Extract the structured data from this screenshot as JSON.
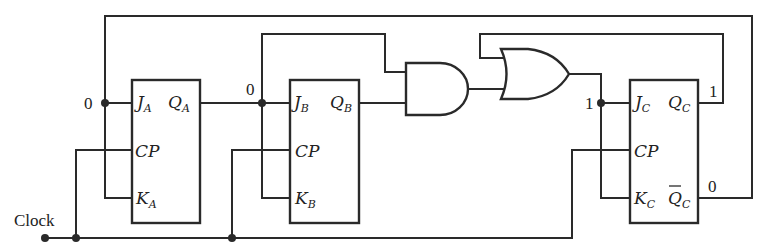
{
  "diagram": {
    "type": "sequential-logic-circuit",
    "clock_label": "Clock",
    "flip_flops": [
      {
        "id": "A",
        "pins": {
          "J": "J",
          "J_sub": "A",
          "Q": "Q",
          "Q_sub": "A",
          "CP": "CP",
          "K": "K",
          "K_sub": "A"
        },
        "input_state": "0"
      },
      {
        "id": "B",
        "pins": {
          "J": "J",
          "J_sub": "B",
          "Q": "Q",
          "Q_sub": "B",
          "CP": "CP",
          "K": "K",
          "K_sub": "B"
        },
        "input_state": "0"
      },
      {
        "id": "C",
        "pins": {
          "J": "J",
          "J_sub": "C",
          "Q": "Q",
          "Q_sub": "C",
          "Qbar": "Q",
          "Qbar_sub": "C",
          "CP": "CP",
          "K": "K",
          "K_sub": "C"
        },
        "input_state": "1",
        "q_state": "1",
        "qbar_state": "0"
      }
    ],
    "gates": [
      {
        "id": "and-gate",
        "type": "AND",
        "inputs": [
          "QA/JB node",
          "QB"
        ]
      },
      {
        "id": "or-gate",
        "type": "OR",
        "inputs": [
          "QC",
          "AND output"
        ]
      }
    ],
    "colors": {
      "line": "#2a2a2a",
      "background": "#ffffff"
    }
  }
}
